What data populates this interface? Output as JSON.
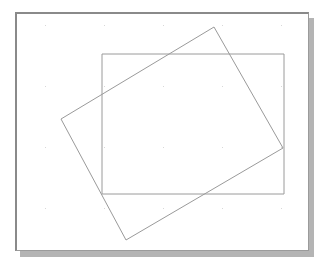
{
  "app": {
    "title": "Drawing Canvas",
    "width": 314,
    "height": 266,
    "background_color": "#ffffff"
  },
  "canvas": {
    "name": "drawing-canvas",
    "x": 15,
    "y": 12,
    "width": 294,
    "height": 239,
    "background_color": "#ffffff",
    "border_color": "#8a8a8a",
    "shadow_color": "#b4b4b4",
    "shadow_offset_x": 5,
    "shadow_offset_y": 6
  },
  "grid": {
    "name": "dot-grid",
    "dot_color": "#d8d8d8",
    "dot_size": 1,
    "spacing_x": 59,
    "spacing_y": 61,
    "origin_x": 28,
    "origin_y": 11,
    "columns": 5,
    "rows": 4
  },
  "shapes": [
    {
      "id": "rectangle",
      "name": "axis-aligned-rectangle",
      "type": "rect",
      "stroke_color": "#9a9a9a",
      "stroke_width": 1,
      "fill": "none",
      "x": 85,
      "y": 40,
      "width": 182,
      "height": 140,
      "points": "85,40 267,40 267,180 85,180"
    },
    {
      "id": "quadrilateral",
      "name": "rotated-quadrilateral",
      "type": "polygon",
      "stroke_color": "#9a9a9a",
      "stroke_width": 1,
      "fill": "none",
      "points": "197,13 266,134 109,226 44,105"
    }
  ]
}
